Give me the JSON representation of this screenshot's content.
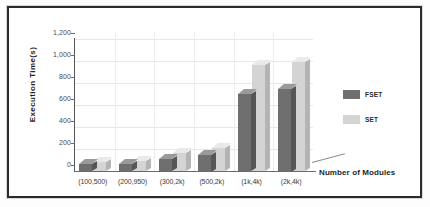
{
  "chart_data": {
    "type": "bar",
    "title": "",
    "subtitle": "",
    "xlabel": "Number of Modules",
    "ylabel": "Execution Time(s)",
    "categories": [
      "(100,500)",
      "(200,950)",
      "(300,2k)",
      "(500,2k)",
      "(1k,4k)",
      "(2k,4k)"
    ],
    "series": [
      {
        "name": "FSET",
        "color": "#6f6f6f",
        "values": [
          60,
          65,
          110,
          150,
          700,
          750
        ]
      },
      {
        "name": "SET",
        "color": "#d4d4d4",
        "values": [
          80,
          90,
          160,
          205,
          960,
          990
        ]
      }
    ],
    "ylim": [
      0,
      1200
    ],
    "yticks": [
      0,
      200,
      400,
      600,
      800,
      1000,
      1200
    ],
    "ytick_labels": [
      "0",
      "200",
      "400",
      "600",
      "800",
      "1,000",
      "1,200"
    ],
    "grid": true,
    "legend_position": "right",
    "style": "3d-column"
  },
  "legend": {
    "entries": [
      {
        "label": "FSET"
      },
      {
        "label": "SET"
      }
    ]
  },
  "axes": {
    "y_title": "Execution Time(s)",
    "x_title": "Number of Modules"
  }
}
